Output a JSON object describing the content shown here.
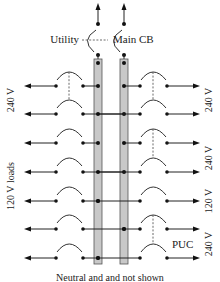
{
  "main": {
    "utility_label": "Utility",
    "main_cb_label": "Main CB",
    "footer_note": "Neutral and and not shown"
  },
  "labels": {
    "left_240_top": "240 V",
    "left_120_loads": "120 V loads",
    "right_240_a": "240 V",
    "right_240_b": "240 V",
    "right_120": "120 V",
    "right_240_c": "240 V",
    "puc": "PUC"
  },
  "layout": {
    "rows_y": [
      86,
      114,
      143,
      172,
      201,
      229,
      258
    ],
    "bus_left_x": 100,
    "bus_right_x": 126
  },
  "rows": [
    {
      "index": 1,
      "left_bus": "L1",
      "right_bus": "L2",
      "left_tie_with_next": true,
      "right_tie_with_next": true
    },
    {
      "index": 2,
      "left_bus": "L2",
      "right_bus": "L1",
      "left_tie_with_next": false,
      "right_tie_with_next": false
    },
    {
      "index": 3,
      "left_bus": "L1",
      "right_bus": "L2",
      "left_tie_with_next": false,
      "right_tie_with_next": true
    },
    {
      "index": 4,
      "left_bus": "L2",
      "right_bus": "L1",
      "left_tie_with_next": false,
      "right_tie_with_next": false
    },
    {
      "index": 5,
      "left_bus": "L1",
      "right_bus": "L1",
      "left_tie_with_next": false,
      "right_tie_with_next": false
    },
    {
      "index": 6,
      "left_bus": "L2",
      "right_bus": "L2",
      "left_tie_with_next": false,
      "right_tie_with_next": true
    },
    {
      "index": 7,
      "left_bus": "L1",
      "right_bus": "L1",
      "left_tie_with_next": false,
      "right_tie_with_next": false
    }
  ],
  "colors": {
    "bus_fill": "#c8c8c8",
    "line": "#222222"
  }
}
